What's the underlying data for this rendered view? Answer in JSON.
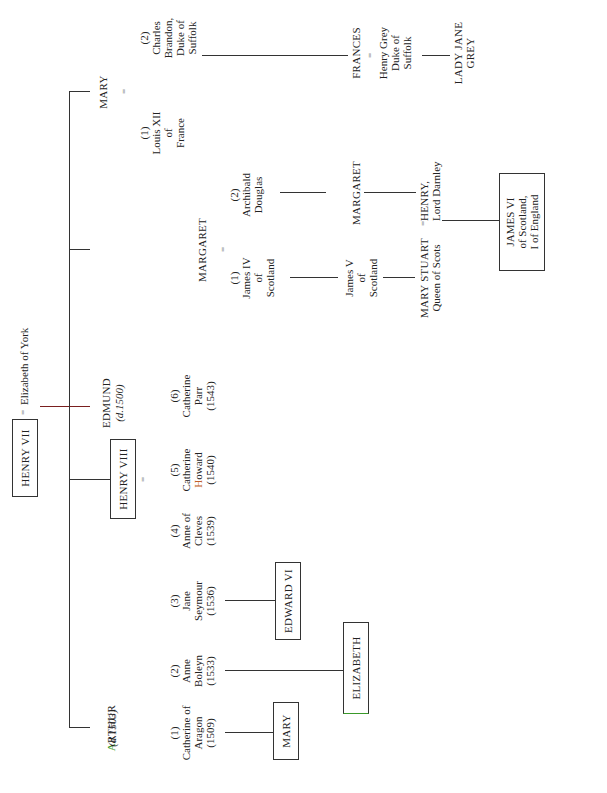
{
  "diagram": {
    "root": {
      "name": "HENRY VII",
      "spouse": "Elizabeth of York",
      "marriage_symbol": "="
    },
    "children": [
      {
        "name": "ARTHUR",
        "first_letter": "A",
        "rest": "RTHUR",
        "note": "(d.1503)"
      },
      {
        "name": "HENRY VIII",
        "marriage_symbol": "="
      },
      {
        "name": "EDMUND",
        "note": "(d.1500)"
      },
      {
        "name": "MARGARET",
        "marriage_symbol": "="
      },
      {
        "name": "MARY",
        "marriage_symbol": "="
      }
    ],
    "henry_viii_wives": [
      {
        "num": "(1)",
        "name": "Catherine of\nAragon",
        "year": "(1509)"
      },
      {
        "num": "(2)",
        "name": "Anne\nBoleyn",
        "year": "(1533)"
      },
      {
        "num": "(3)",
        "name": "Jane\nSeymour",
        "year": "(1536)"
      },
      {
        "num": "(4)",
        "name": "Anne of\nCleves",
        "year": "(1539)"
      },
      {
        "num": "(5)",
        "name_top": "Catherine",
        "name_bottom_first": "H",
        "name_bottom_rest": "oward",
        "year": "(1540)"
      },
      {
        "num": "(6)",
        "name": "Catherine\nParr",
        "year": "(1543)"
      }
    ],
    "henry_viii_children": [
      {
        "name": "MARY"
      },
      {
        "name": "ELIZABETH"
      },
      {
        "name": "EDWARD VI"
      }
    ],
    "margaret_husbands": [
      {
        "num": "(1)",
        "name": "James IV\nof\nScotland"
      },
      {
        "num": "(2)",
        "name": "Archibald\nDouglas"
      }
    ],
    "margaret_line": {
      "james_v": "James V\nof\nScotland",
      "margaret_douglas": "MARGARET",
      "mary_stuart": "MARY STUART",
      "mary_stuart_title": "Queen of Scots",
      "henry_darnley": "HENRY,",
      "henry_darnley_title": "Lord Darnley",
      "marriage_symbol": "=",
      "james_vi": "JAMES VI\nof Scotland,\nI of England"
    },
    "mary_husbands": [
      {
        "num": "(1)",
        "name": "Louis XII\nof\nFrance"
      },
      {
        "num": "(2)",
        "name": "Charles\nBrandon,\nDuke of\nSuffolk"
      }
    ],
    "mary_line": {
      "frances": "FRANCES",
      "marriage_symbol": "=",
      "henry_grey": "Henry Grey\nDuke of\nSuffolk",
      "lady_jane_grey": "LADY JANE\nGREY"
    },
    "colors": {
      "line": "#333333",
      "root_connector": "#7a1f1f",
      "highlight_green": "#3a9a2a",
      "highlight_orange": "#c0602a"
    }
  }
}
